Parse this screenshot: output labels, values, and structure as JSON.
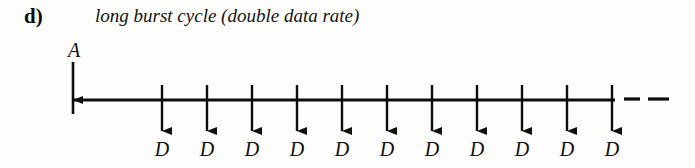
{
  "figure": {
    "part_label": "d)",
    "caption": "long burst cycle (double data rate)",
    "background_color": "#fdfdfc",
    "ink_color": "#0d0d0d"
  },
  "diagram": {
    "type": "timing-diagram",
    "axis": {
      "orientation": "horizontal",
      "x_start": 73,
      "x_end": 615,
      "y": 100,
      "stroke_width": 3.2,
      "continuation_dashes": [
        {
          "x1": 624,
          "x2": 640,
          "y": 99
        },
        {
          "x1": 648,
          "x2": 669,
          "y": 99
        }
      ]
    },
    "address_signal": {
      "name": "A",
      "label": "A",
      "direction": "down-into-bus",
      "x": 73,
      "stem_top": 62,
      "arrow_tip": 100,
      "stub_bottom": 114,
      "label_x": 62,
      "label_y": 40
    },
    "data_signals": {
      "label": "D",
      "count": 11,
      "direction": "down-from-bus",
      "stem_top": 85,
      "arrow_tip": 131,
      "label_y": 139,
      "spacing": 45,
      "positions": [
        162,
        207,
        252,
        297,
        342,
        387,
        432,
        477,
        522,
        567,
        612
      ],
      "labels": [
        "D",
        "D",
        "D",
        "D",
        "D",
        "D",
        "D",
        "D",
        "D",
        "D",
        "D"
      ]
    }
  }
}
